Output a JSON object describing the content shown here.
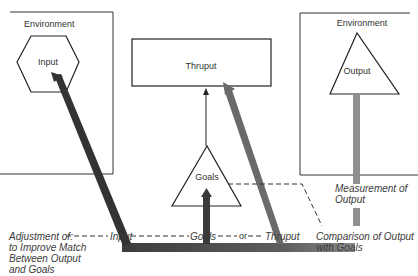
{
  "diagram": {
    "nodes": {
      "env_left": {
        "label": "Environment"
      },
      "input": {
        "label": "Input",
        "shape": "hexagon"
      },
      "thruput": {
        "label": "Thruput",
        "shape": "rectangle"
      },
      "env_right": {
        "label": "Environment"
      },
      "output": {
        "label": "Output",
        "shape": "triangle"
      },
      "goals": {
        "label": "Goals",
        "shape": "triangle"
      }
    },
    "annotations": {
      "adjustment": "Adjustment of:\nto Improve Match\nBetween Output\nand Goals",
      "measurement": "Measurement of\nOutput",
      "comparison": "Comparison of Output\nwith Goals"
    },
    "feedback_line": {
      "input": "Input",
      "goals": "Goals",
      "or": "or",
      "thruput": "Thruput"
    },
    "colors": {
      "line": "#2a2a2a",
      "arrow_dark": "#3a3a3a",
      "arrow_mid": "#6a6a6a",
      "arrow_light": "#8f8f8f"
    }
  }
}
